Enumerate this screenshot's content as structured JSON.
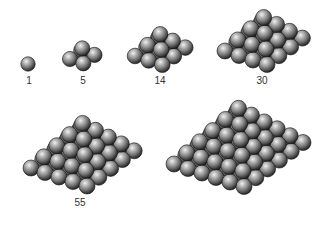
{
  "figure": {
    "ball_colors": {
      "highlight": "#f2f2f2",
      "mid": "#8a8a8a",
      "shadow": "#1e1e1e",
      "edge": "#111111"
    },
    "pyramids": [
      {
        "layers": 1,
        "count_label": "1",
        "origin": [
          28,
          64
        ],
        "radius": 7.2,
        "label_pos": [
          29,
          84
        ]
      },
      {
        "layers": 2,
        "count_label": "5",
        "origin": [
          70,
          59
        ],
        "radius": 7.6,
        "label_pos": [
          83,
          84
        ]
      },
      {
        "layers": 3,
        "count_label": "14",
        "origin": [
          135,
          56
        ],
        "radius": 7.8,
        "label_pos": [
          160,
          84
        ]
      },
      {
        "layers": 4,
        "count_label": "30",
        "origin": [
          225,
          51
        ],
        "radius": 8,
        "label_pos": [
          262,
          84
        ]
      },
      {
        "layers": 5,
        "count_label": "55",
        "origin": [
          31,
          168
        ],
        "radius": 8,
        "label_pos": [
          80,
          206
        ]
      },
      {
        "layers": 6,
        "count_label": "",
        "origin": [
          174,
          164
        ],
        "radius": 8,
        "label_pos": [
          250,
          206
        ]
      }
    ],
    "step_a": [
      14.0,
      4.5
    ],
    "step_b": [
      11.8,
      -8.8
    ],
    "layer_rise": 9.0
  }
}
